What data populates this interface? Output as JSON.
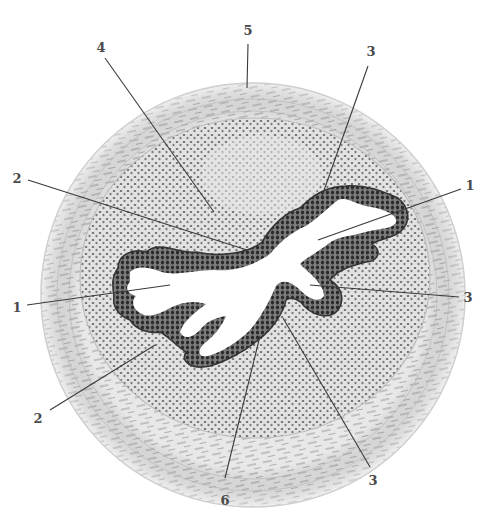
{
  "figure": {
    "type": "histological cross-section illustration",
    "background": "#ffffff",
    "tissue_fill": "#e6e6e6",
    "stroma_fill": "#dedede",
    "nucleus_color": "#5a5a5a",
    "epithelium_color": "#3c3c3c",
    "lumen_color": "#ffffff",
    "leader_color": "#3a3a3a"
  },
  "labels": [
    {
      "id": "5-top",
      "text": "5",
      "x": 248,
      "y": 30,
      "line": [
        248,
        44,
        247,
        88
      ]
    },
    {
      "id": "4-top",
      "text": "4",
      "x": 101,
      "y": 47,
      "line": [
        105,
        58,
        214,
        212
      ]
    },
    {
      "id": "3-top-right",
      "text": "3",
      "x": 371,
      "y": 51,
      "line": [
        368,
        66,
        322,
        196
      ]
    },
    {
      "id": "2-left-upper",
      "text": "2",
      "x": 17,
      "y": 178,
      "line": [
        28,
        180,
        247,
        250
      ]
    },
    {
      "id": "1-right",
      "text": "1",
      "x": 470,
      "y": 185,
      "line": [
        461,
        189,
        318,
        240
      ]
    },
    {
      "id": "1-left",
      "text": "1",
      "x": 17,
      "y": 307,
      "line": [
        27,
        305,
        170,
        285
      ]
    },
    {
      "id": "3-right",
      "text": "3",
      "x": 468,
      "y": 297,
      "line": [
        459,
        297,
        310,
        285
      ]
    },
    {
      "id": "2-lower-left",
      "text": "2",
      "x": 38,
      "y": 418,
      "line": [
        50,
        410,
        155,
        345
      ]
    },
    {
      "id": "6-bottom",
      "text": "6",
      "x": 225,
      "y": 500,
      "line": [
        225,
        478,
        260,
        336
      ]
    },
    {
      "id": "3-bottom-right",
      "text": "3",
      "x": 373,
      "y": 480,
      "line": [
        370,
        467,
        283,
        318
      ]
    }
  ]
}
